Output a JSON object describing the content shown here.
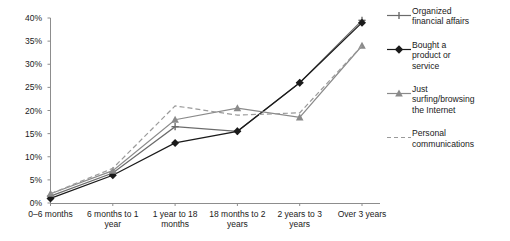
{
  "chart_data": {
    "type": "line",
    "title": "",
    "xlabel": "",
    "ylabel": "",
    "ylim": [
      0,
      40
    ],
    "yticks": [
      "0%",
      "5%",
      "10%",
      "15%",
      "20%",
      "25%",
      "30%",
      "35%",
      "40%"
    ],
    "ytick_values": [
      0,
      5,
      10,
      15,
      20,
      25,
      30,
      35,
      40
    ],
    "grid": false,
    "legend_position": "right",
    "categories": [
      "0–6 months",
      "6 months to 1 year",
      "1 year to 18 months",
      "18 months to 2 years",
      "2 years to 3 years",
      "Over 3 years"
    ],
    "series": [
      {
        "name": "Organized financial affairs",
        "marker": "cross",
        "color": "#6b6b6b",
        "dash": "solid",
        "values": [
          1.5,
          6.5,
          16.5,
          15.5,
          26.0,
          39.5
        ]
      },
      {
        "name": "Bought a product or service",
        "marker": "diamond",
        "color": "#1a1a1a",
        "dash": "solid",
        "values": [
          1.0,
          6.0,
          13.0,
          15.5,
          26.0,
          39.0
        ]
      },
      {
        "name": "Just surfing/browsing the Internet",
        "marker": "triangle",
        "color": "#8a8a8a",
        "dash": "solid",
        "values": [
          2.0,
          7.0,
          18.0,
          20.5,
          18.5,
          34.0
        ]
      },
      {
        "name": "Personal communications",
        "marker": "none",
        "color": "#9a9a9a",
        "dash": "dashed",
        "values": [
          2.0,
          7.5,
          21.0,
          19.0,
          19.5,
          34.0
        ]
      }
    ]
  },
  "legend": {
    "items": [
      {
        "label": "Organized\nfinancial affairs"
      },
      {
        "label": "Bought a\nproduct or\nservice"
      },
      {
        "label": "Just\nsurfing/browsing\nthe Internet"
      },
      {
        "label": "Personal\ncommunications"
      }
    ]
  }
}
